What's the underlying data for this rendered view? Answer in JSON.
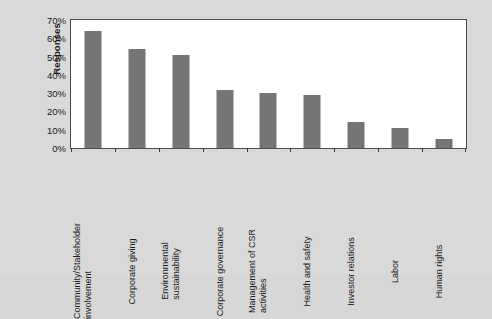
{
  "chart_data": {
    "type": "bar",
    "title": "",
    "xlabel": "",
    "ylabel": "Responses",
    "ylim": [
      0,
      70
    ],
    "y_tick_labels": [
      "0%",
      "10%",
      "20%",
      "30%",
      "40%",
      "50%",
      "60%",
      "70%"
    ],
    "y_tick_values": [
      0,
      10,
      20,
      30,
      40,
      50,
      60,
      70
    ],
    "grid": false,
    "legend": false,
    "bar_color": "#757575",
    "plot_background": "#ffffff",
    "figure_background": "#d9d9d9",
    "categories": [
      "Community/Stakeholder involvement",
      "Corporate giving",
      "Environmental sustainability",
      "Corporate governance",
      "Management of CSR activities",
      "Health and safety",
      "Investor relations",
      "Labor",
      "Human rights"
    ],
    "category_lines": [
      [
        "Community/Stakeholder",
        "involvement"
      ],
      [
        "Corporate giving",
        ""
      ],
      [
        "Environmental",
        "sustainability"
      ],
      [
        "Corporate governance",
        ""
      ],
      [
        "Management of CSR",
        "activities"
      ],
      [
        "Health and safety",
        ""
      ],
      [
        "Investor relations",
        ""
      ],
      [
        "Labor",
        ""
      ],
      [
        "Human rights",
        ""
      ]
    ],
    "values": [
      64,
      54,
      51,
      32,
      30,
      29,
      14,
      11,
      5
    ]
  }
}
